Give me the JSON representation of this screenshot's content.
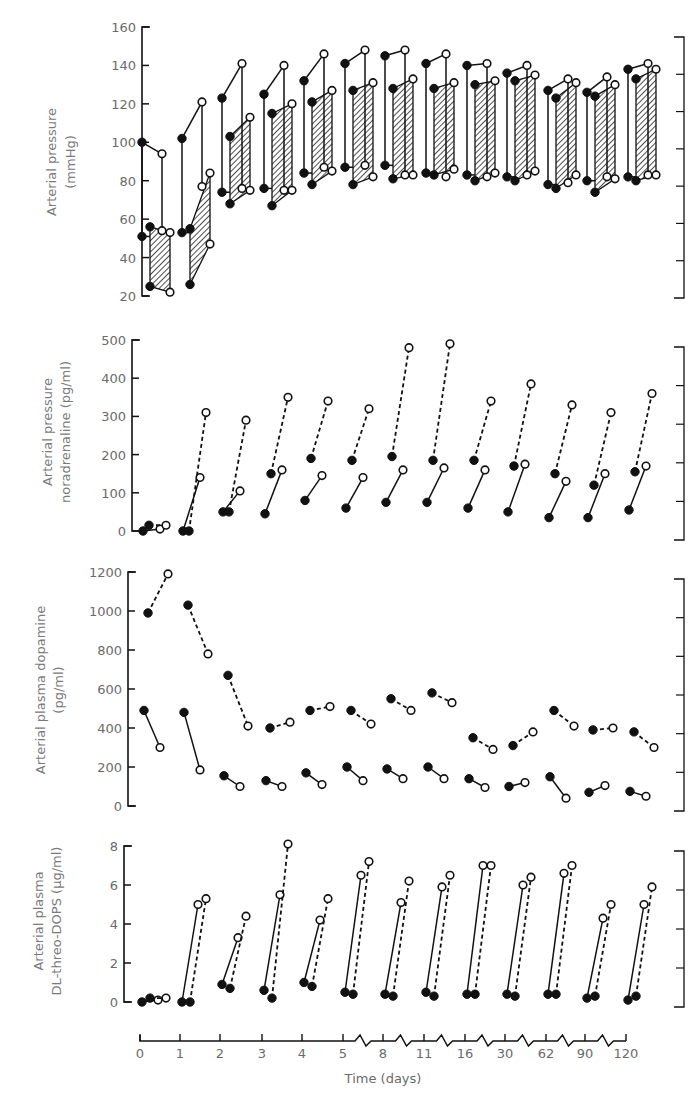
{
  "figure": {
    "x_axis": {
      "title": "Time (days)",
      "ticks": [
        "0",
        "1",
        "2",
        "3",
        "4",
        "5",
        "8",
        "11",
        "16",
        "30",
        "62",
        "90",
        "120"
      ]
    },
    "panels": [
      {
        "id": "arterial-pressure",
        "ylabel_line1": "Arterial pressure",
        "ylabel_line2": "(mmHg)",
        "yticks": [
          "160",
          "140",
          "120",
          "100",
          "80",
          "60",
          "40",
          "20"
        ]
      },
      {
        "id": "noradrenaline",
        "ylabel_line1": "Arterial pressure",
        "ylabel_line2": "noradrenaline (pg/ml)",
        "yticks": [
          "500",
          "400",
          "300",
          "200",
          "100",
          "0"
        ]
      },
      {
        "id": "dopamine",
        "ylabel_line1": "Arterial plasma dopamine",
        "ylabel_line2": "(pg/ml)",
        "yticks": [
          "1200",
          "1000",
          "800",
          "600",
          "400",
          "200",
          "0"
        ]
      },
      {
        "id": "dops",
        "ylabel_line1": "Arterial plasma",
        "ylabel_line2": "DL-threo-DOPS (µg/ml)",
        "yticks": [
          "8",
          "6",
          "4",
          "2",
          "0"
        ]
      }
    ]
  },
  "chart_data": [
    {
      "type": "line",
      "title": "Arterial pressure",
      "xlabel": "Time (days)",
      "ylabel": "Arterial pressure (mmHg)",
      "ylim": [
        20,
        160
      ],
      "categories": [
        "0",
        "1",
        "2",
        "3",
        "4",
        "5",
        "8",
        "11",
        "16",
        "30",
        "62",
        "90",
        "120"
      ],
      "grid": false,
      "note": "Each day: filled circle = before dose, open circle = after dose; vertical lines link systolic and diastolic; hatched boxes show second-dose systolic/diastolic range",
      "series": [
        {
          "name": "Dose 1 systolic (before→after)",
          "values": [
            [
              100,
              94
            ],
            [
              102,
              121
            ],
            [
              123,
              141
            ],
            [
              125,
              140
            ],
            [
              132,
              146
            ],
            [
              141,
              148
            ],
            [
              145,
              148
            ],
            [
              141,
              146
            ],
            [
              140,
              141
            ],
            [
              136,
              140
            ],
            [
              127,
              133
            ],
            [
              126,
              134
            ],
            [
              138,
              141
            ]
          ]
        },
        {
          "name": "Dose 1 diastolic (before→after)",
          "values": [
            [
              51,
              54
            ],
            [
              53,
              77
            ],
            [
              74,
              76
            ],
            [
              76,
              75
            ],
            [
              84,
              87
            ],
            [
              87,
              88
            ],
            [
              88,
              83
            ],
            [
              84,
              82
            ],
            [
              83,
              82
            ],
            [
              82,
              83
            ],
            [
              78,
              79
            ],
            [
              80,
              82
            ],
            [
              82,
              83
            ]
          ]
        },
        {
          "name": "Dose 2 systolic (before→after)",
          "values": [
            [
              56,
              53
            ],
            [
              55,
              84
            ],
            [
              103,
              113
            ],
            [
              115,
              120
            ],
            [
              121,
              127
            ],
            [
              127,
              131
            ],
            [
              128,
              133
            ],
            [
              128,
              131
            ],
            [
              130,
              132
            ],
            [
              132,
              135
            ],
            [
              123,
              131
            ],
            [
              124,
              130
            ],
            [
              133,
              138
            ]
          ]
        },
        {
          "name": "Dose 2 diastolic (before→after)",
          "values": [
            [
              25,
              22
            ],
            [
              26,
              47
            ],
            [
              68,
              75
            ],
            [
              67,
              75
            ],
            [
              78,
              85
            ],
            [
              78,
              82
            ],
            [
              81,
              83
            ],
            [
              83,
              86
            ],
            [
              80,
              84
            ],
            [
              80,
              85
            ],
            [
              76,
              83
            ],
            [
              74,
              81
            ],
            [
              80,
              83
            ]
          ]
        }
      ]
    },
    {
      "type": "line",
      "title": "Noradrenaline",
      "xlabel": "Time (days)",
      "ylabel": "Arterial pressure noradrenaline (pg/ml)",
      "ylim": [
        0,
        500
      ],
      "categories": [
        "0",
        "1",
        "2",
        "3",
        "4",
        "5",
        "8",
        "11",
        "16",
        "30",
        "62",
        "90",
        "120"
      ],
      "grid": false,
      "series": [
        {
          "name": "Dose 1 (solid, before→after)",
          "values": [
            [
              0,
              5
            ],
            [
              0,
              140
            ],
            [
              50,
              105
            ],
            [
              45,
              160
            ],
            [
              80,
              145
            ],
            [
              60,
              140
            ],
            [
              75,
              160
            ],
            [
              75,
              165
            ],
            [
              60,
              160
            ],
            [
              50,
              175
            ],
            [
              35,
              130
            ],
            [
              35,
              150
            ],
            [
              55,
              170
            ]
          ]
        },
        {
          "name": "Dose 2 (dashed, before→after)",
          "values": [
            [
              15,
              15
            ],
            [
              0,
              310
            ],
            [
              50,
              290
            ],
            [
              150,
              350
            ],
            [
              190,
              340
            ],
            [
              185,
              320
            ],
            [
              195,
              480
            ],
            [
              185,
              490
            ],
            [
              185,
              340
            ],
            [
              170,
              385
            ],
            [
              150,
              330
            ],
            [
              120,
              310
            ],
            [
              155,
              360
            ]
          ]
        }
      ]
    },
    {
      "type": "line",
      "title": "Dopamine",
      "xlabel": "Time (days)",
      "ylabel": "Arterial plasma dopamine (pg/ml)",
      "ylim": [
        0,
        1200
      ],
      "categories": [
        "0",
        "1",
        "2",
        "3",
        "4",
        "5",
        "8",
        "11",
        "16",
        "30",
        "62",
        "90",
        "120"
      ],
      "grid": false,
      "series": [
        {
          "name": "Dose 1 (solid, before→after)",
          "values": [
            [
              490,
              300
            ],
            [
              480,
              185
            ],
            [
              155,
              100
            ],
            [
              130,
              100
            ],
            [
              170,
              110
            ],
            [
              200,
              130
            ],
            [
              190,
              140
            ],
            [
              200,
              140
            ],
            [
              140,
              95
            ],
            [
              100,
              120
            ],
            [
              150,
              40
            ],
            [
              70,
              105
            ],
            [
              75,
              50
            ]
          ]
        },
        {
          "name": "Dose 2 (dashed, before→after)",
          "values": [
            [
              990,
              1190
            ],
            [
              1030,
              780
            ],
            [
              670,
              410
            ],
            [
              400,
              430
            ],
            [
              490,
              510
            ],
            [
              490,
              420
            ],
            [
              550,
              490
            ],
            [
              580,
              530
            ],
            [
              350,
              290
            ],
            [
              310,
              380
            ],
            [
              490,
              410
            ],
            [
              390,
              400
            ],
            [
              380,
              300
            ]
          ]
        }
      ]
    },
    {
      "type": "line",
      "title": "DL-threo-DOPS",
      "xlabel": "Time (days)",
      "ylabel": "Arterial plasma DL-threo-DOPS (µg/ml)",
      "ylim": [
        0,
        8
      ],
      "categories": [
        "0",
        "1",
        "2",
        "3",
        "4",
        "5",
        "8",
        "11",
        "16",
        "30",
        "62",
        "90",
        "120"
      ],
      "grid": false,
      "series": [
        {
          "name": "Dose 1 (solid, before→after)",
          "values": [
            [
              0,
              0.1
            ],
            [
              0,
              5.0
            ],
            [
              0.9,
              3.3
            ],
            [
              0.6,
              5.5
            ],
            [
              1.0,
              4.2
            ],
            [
              0.5,
              6.5
            ],
            [
              0.4,
              5.1
            ],
            [
              0.5,
              5.9
            ],
            [
              0.4,
              7.0
            ],
            [
              0.4,
              6.0
            ],
            [
              0.4,
              6.6
            ],
            [
              0.2,
              4.3
            ],
            [
              0.1,
              5.0
            ]
          ]
        },
        {
          "name": "Dose 2 (dashed, before→after)",
          "values": [
            [
              0.2,
              0.2
            ],
            [
              0,
              5.3
            ],
            [
              0.7,
              4.4
            ],
            [
              0.2,
              8.1
            ],
            [
              0.8,
              5.3
            ],
            [
              0.4,
              7.2
            ],
            [
              0.3,
              6.2
            ],
            [
              0.3,
              6.5
            ],
            [
              0.4,
              7.0
            ],
            [
              0.3,
              6.4
            ],
            [
              0.4,
              7.0
            ],
            [
              0.3,
              5.0
            ],
            [
              0.3,
              5.9
            ]
          ]
        }
      ]
    }
  ]
}
